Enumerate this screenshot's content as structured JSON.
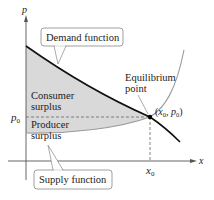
{
  "diagram": {
    "axes": {
      "y_label": "p",
      "x_label": "x",
      "p0_label": "p",
      "p0_sub": "0",
      "x0_label": "x",
      "x0_sub": "0"
    },
    "callouts": {
      "demand": "Demand function",
      "supply": "Supply function"
    },
    "regions": {
      "consumer_line1": "Consumer",
      "consumer_line2": "surplus",
      "producer_line1": "Producer",
      "producer_line2": "surplus"
    },
    "equilibrium": {
      "line1": "Equilibrium",
      "line2": "point",
      "coord_open": "(",
      "coord_x": "x",
      "coord_x_sub": "0",
      "coord_sep": ", ",
      "coord_p": "p",
      "coord_p_sub": "0",
      "coord_close": ")"
    },
    "colors": {
      "shading": "#d9d9d9",
      "demand_curve": "#111111",
      "supply_curve": "#9a9a9a",
      "axes": "#555555",
      "callout_border": "#888888"
    }
  }
}
